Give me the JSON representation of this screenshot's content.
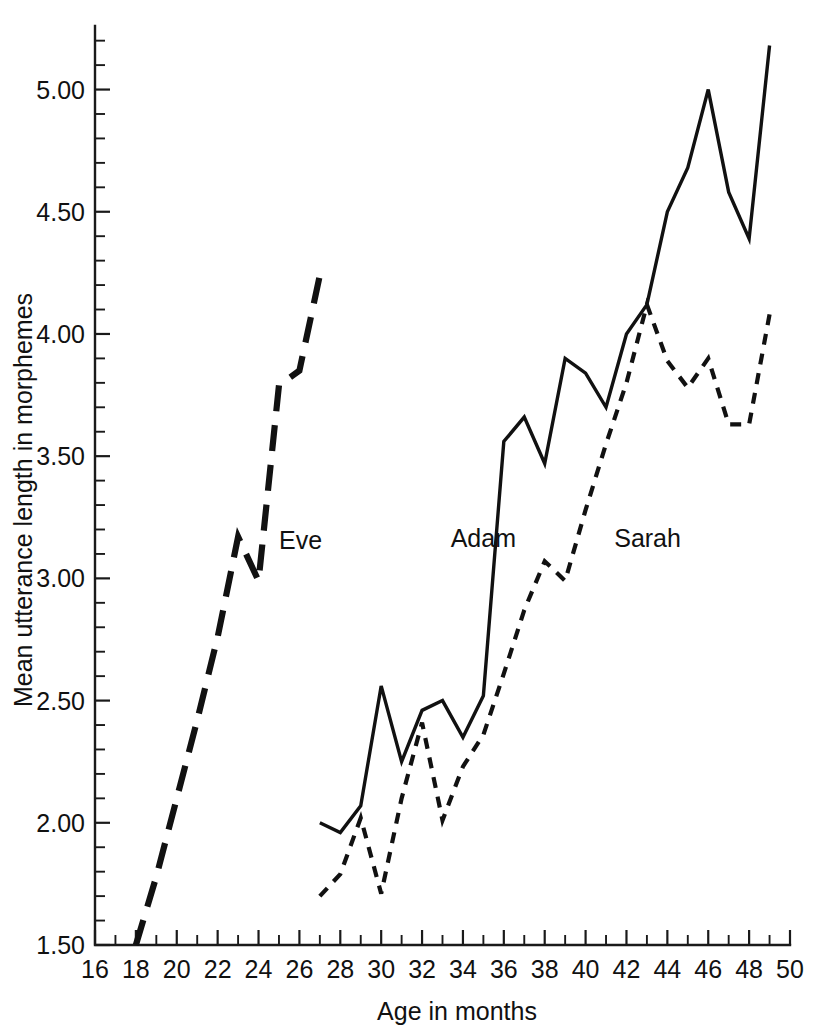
{
  "chart_data": {
    "type": "line",
    "title": "",
    "xlabel": "Age in months",
    "ylabel": "Mean utterance length in morphemes",
    "xlim": [
      16,
      50
    ],
    "ylim": [
      1.5,
      5.26
    ],
    "grid": false,
    "legend_position": "inline-labels",
    "x_major_ticks": [
      16,
      18,
      20,
      22,
      24,
      26,
      28,
      30,
      32,
      34,
      36,
      38,
      40,
      42,
      44,
      46,
      48,
      50
    ],
    "x_major_tick_labels": [
      "16",
      "18",
      "20",
      "22",
      "24",
      "26",
      "28",
      "30",
      "32",
      "34",
      "36",
      "38",
      "40",
      "42",
      "44",
      "46",
      "48",
      "50"
    ],
    "x_minor_ticks": [
      17,
      19,
      21,
      23,
      25,
      27,
      29,
      31,
      33,
      35,
      37,
      39,
      41,
      43,
      45,
      47,
      49
    ],
    "y_major_ticks": [
      1.5,
      2.0,
      2.5,
      3.0,
      3.5,
      4.0,
      4.5,
      5.0
    ],
    "y_major_tick_labels": [
      "1.50",
      "2.00",
      "2.50",
      "3.00",
      "3.50",
      "4.00",
      "4.50",
      "5.00"
    ],
    "y_minor_ticks": [
      1.6,
      1.7,
      1.8,
      1.9,
      2.1,
      2.2,
      2.3,
      2.4,
      2.6,
      2.7,
      2.8,
      2.9,
      3.1,
      3.2,
      3.3,
      3.4,
      3.6,
      3.7,
      3.8,
      3.9,
      4.1,
      4.2,
      4.3,
      4.4,
      4.6,
      4.7,
      4.8,
      4.9,
      5.1,
      5.2
    ],
    "series": [
      {
        "name": "Eve",
        "style": "long-dashed",
        "label_x": 25.0,
        "label_y": 3.12,
        "x": [
          18,
          19,
          20,
          21,
          22,
          23,
          24,
          25,
          26,
          27
        ],
        "values": [
          1.5,
          1.78,
          2.1,
          2.42,
          2.76,
          3.17,
          2.99,
          3.79,
          3.85,
          4.24
        ]
      },
      {
        "name": "Adam",
        "style": "solid",
        "label_x": 33.4,
        "label_y": 3.13,
        "x": [
          27,
          28,
          29,
          30,
          31,
          32,
          33,
          34,
          35,
          36,
          37,
          38,
          39,
          40,
          41,
          42,
          43,
          44,
          45,
          46,
          47,
          48,
          49
        ],
        "values": [
          2.0,
          1.96,
          2.07,
          2.56,
          2.25,
          2.46,
          2.5,
          2.35,
          2.52,
          3.56,
          3.66,
          3.47,
          3.9,
          3.84,
          3.7,
          4.0,
          4.12,
          4.5,
          4.68,
          5.0,
          4.58,
          4.39,
          5.18
        ]
      },
      {
        "name": "Sarah",
        "style": "dotted",
        "label_x": 41.4,
        "label_y": 3.13,
        "x": [
          27,
          28,
          29,
          30,
          31,
          32,
          33,
          34,
          35,
          36,
          37,
          38,
          39,
          40,
          41,
          42,
          43,
          44,
          45,
          46,
          47,
          48,
          49
        ],
        "values": [
          1.7,
          1.79,
          2.02,
          1.71,
          2.1,
          2.41,
          2.01,
          2.23,
          2.36,
          2.61,
          2.87,
          3.07,
          2.99,
          3.28,
          3.55,
          3.8,
          4.12,
          3.89,
          3.78,
          3.9,
          3.63,
          3.63,
          4.08
        ]
      }
    ]
  }
}
